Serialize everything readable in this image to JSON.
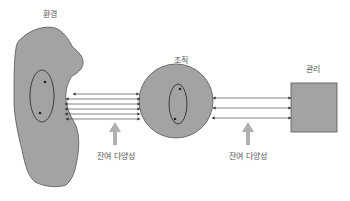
{
  "labels": {
    "environment": "환경",
    "organization": "조직",
    "management": "관리",
    "requisite_variety_left": "잔여 다양성",
    "requisite_variety_right": "잔여 다양성"
  },
  "colors": {
    "shape_fill": "#a3a3a3",
    "shape_stroke": "#555555",
    "line": "#444444",
    "connector_line": "#666666",
    "up_arrow": "#b0b0b0",
    "text": "#555555"
  },
  "connections": {
    "environment_to_organization_count": 6,
    "organization_to_management_count": 3
  }
}
